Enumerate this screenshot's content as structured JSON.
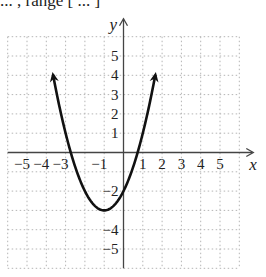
{
  "top_text": "... , range [ ... ]",
  "chart_data": {
    "type": "line",
    "title": "",
    "function": "y = x^2 + 2x - 2",
    "xlabel": "x",
    "ylabel": "y",
    "xlim": [
      -6,
      6
    ],
    "ylim": [
      -6,
      6
    ],
    "grid": true,
    "grid_style": "dotted",
    "x_tick_labels": [
      "-5",
      "-4",
      "-3",
      "-1",
      "1",
      "2",
      "3",
      "4",
      "5"
    ],
    "y_tick_labels": [
      "5",
      "4",
      "3",
      "2",
      "1",
      "-2",
      "-4",
      "-5"
    ],
    "vertex": [
      -1,
      -3
    ],
    "y_intercept": -2,
    "x_intercepts": [
      -2.73,
      0.73
    ],
    "x": [
      -3.65,
      -3,
      -2,
      -1,
      0,
      1,
      1.65
    ],
    "y": [
      5.0,
      1,
      -2,
      -3,
      -2,
      1,
      5.0
    ],
    "arrows_on_ends": true
  }
}
